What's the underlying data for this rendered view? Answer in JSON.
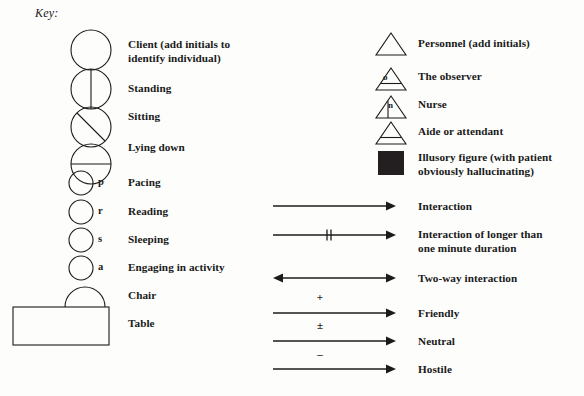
{
  "title": "Key:",
  "left_column": {
    "items": [
      {
        "id": "client",
        "symbol": "circle-plain",
        "letter": "",
        "label": "Client (add initials to\nidentify individual)"
      },
      {
        "id": "standing",
        "symbol": "circle-vertical-line",
        "letter": "",
        "label": "Standing"
      },
      {
        "id": "sitting",
        "symbol": "circle-diagonal-line",
        "letter": "",
        "label": "Sitting"
      },
      {
        "id": "lying",
        "symbol": "circle-horizontal-line",
        "letter": "",
        "label": "Lying down"
      },
      {
        "id": "pacing",
        "symbol": "circle-small",
        "letter": "p",
        "label": "Pacing"
      },
      {
        "id": "reading",
        "symbol": "circle-small",
        "letter": "r",
        "label": "Reading"
      },
      {
        "id": "sleeping",
        "symbol": "circle-small",
        "letter": "s",
        "label": "Sleeping"
      },
      {
        "id": "activity",
        "symbol": "circle-small",
        "letter": "a",
        "label": "Engaging in activity"
      },
      {
        "id": "chair",
        "symbol": "semicircle-arc",
        "letter": "",
        "label": "Chair"
      },
      {
        "id": "table",
        "symbol": "rectangle",
        "letter": "",
        "label": "Table"
      }
    ]
  },
  "right_column": {
    "figures": [
      {
        "id": "personnel",
        "symbol": "triangle-plain",
        "letter": "",
        "label": "Personnel (add initials)"
      },
      {
        "id": "observer",
        "symbol": "triangle-base-line",
        "letter": "o",
        "label": "The observer"
      },
      {
        "id": "nurse",
        "symbol": "triangle-vertical-line",
        "letter": "n",
        "label": "Nurse"
      },
      {
        "id": "aide",
        "symbol": "triangle-base-line",
        "letter": "",
        "label": "Aide or attendant"
      },
      {
        "id": "illusory",
        "symbol": "filled-square",
        "letter": "",
        "label": "Illusory figure (with patient\nobviously hallucinating)"
      }
    ],
    "arrows": [
      {
        "id": "interaction",
        "symbol": "arrow-right",
        "sign": "",
        "label": "Interaction"
      },
      {
        "id": "interaction-long",
        "symbol": "arrow-right-doubletick",
        "sign": "",
        "label": "Interaction of longer than\none minute duration"
      },
      {
        "id": "two-way",
        "symbol": "arrow-double",
        "sign": "",
        "label": "Two-way interaction"
      },
      {
        "id": "friendly",
        "symbol": "arrow-right",
        "sign": "+",
        "label": "Friendly"
      },
      {
        "id": "neutral",
        "symbol": "arrow-right",
        "sign": "±",
        "label": "Neutral"
      },
      {
        "id": "hostile",
        "symbol": "arrow-right",
        "sign": "–",
        "label": "Hostile"
      }
    ]
  },
  "colors": {
    "ink": "#1b1b1b",
    "fill_solid": "#231f20",
    "background": "#fdfdfb"
  }
}
